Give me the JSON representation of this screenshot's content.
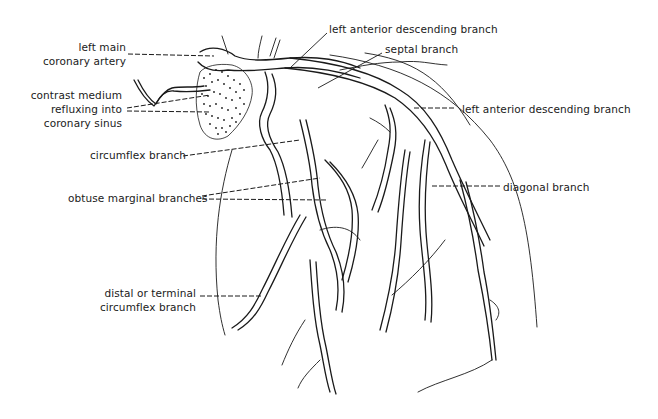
{
  "diagram": {
    "labels": {
      "left_main": [
        "left main",
        "coronary artery"
      ],
      "contrast": [
        "contrast medium",
        "refluxing into",
        "coronary sinus"
      ],
      "circumflex": "circumflex branch",
      "obtuse_marginal": "obtuse marginal branches",
      "distal_circumflex": [
        "distal or terminal",
        "circumflex branch"
      ],
      "lad_top": "left anterior descending branch",
      "septal": "septal branch",
      "lad_right": "left anterior descending branch",
      "diagonal": "diagonal branch"
    }
  }
}
